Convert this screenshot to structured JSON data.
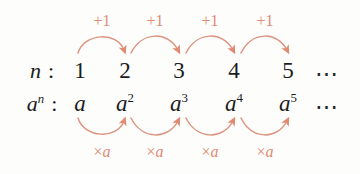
{
  "diagram": {
    "background_color": "#fdfdfb",
    "text_color": "#1b1b1b",
    "accent_color": "#e08a74",
    "rows": [
      {
        "id": "n-row",
        "label": "n",
        "label_superscript": "",
        "separator": ":",
        "cells": [
          {
            "value": "1",
            "superscript": ""
          },
          {
            "value": "2",
            "superscript": ""
          },
          {
            "value": "3",
            "superscript": ""
          },
          {
            "value": "4",
            "superscript": ""
          },
          {
            "value": "5",
            "superscript": ""
          }
        ],
        "trailing": "⋯"
      },
      {
        "id": "an-row",
        "label": "a",
        "label_superscript": "n",
        "separator": ":",
        "cells": [
          {
            "value": "a",
            "superscript": ""
          },
          {
            "value": "a",
            "superscript": "2"
          },
          {
            "value": "a",
            "superscript": "3"
          },
          {
            "value": "a",
            "superscript": "4"
          },
          {
            "value": "a",
            "superscript": "5"
          }
        ],
        "trailing": "⋯"
      }
    ],
    "top_operations": [
      {
        "symbol": "+",
        "operand": "1"
      },
      {
        "symbol": "+",
        "operand": "1"
      },
      {
        "symbol": "+",
        "operand": "1"
      },
      {
        "symbol": "+",
        "operand": "1"
      }
    ],
    "bottom_operations": [
      {
        "symbol": "×",
        "operand": "a"
      },
      {
        "symbol": "×",
        "operand": "a"
      },
      {
        "symbol": "×",
        "operand": "a"
      },
      {
        "symbol": "×",
        "operand": "a"
      }
    ],
    "column_x": [
      80,
      125,
      179,
      234,
      288
    ],
    "trailing_x": 327,
    "row_label_x": 42,
    "row_y": {
      "top": 71,
      "bottom": 104
    },
    "op_label_y": {
      "top": 21,
      "bottom": 152
    }
  }
}
